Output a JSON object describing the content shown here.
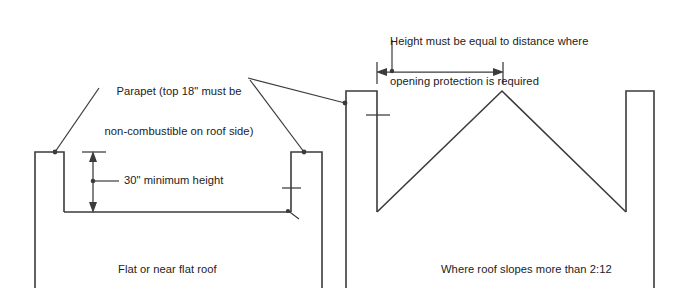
{
  "diagram": {
    "ink_color": "#3b3b3b",
    "background_color": "#ffffff",
    "labels": {
      "parapet_note": {
        "line1": "Parapet (top 18\" must be",
        "line2": "non-combustible on roof side)"
      },
      "height_rule_note": {
        "line1": "Height must be equal to distance where",
        "line2": "opening protection is required"
      },
      "minimum_height": "30\" minimum height",
      "flat_roof_caption": "Flat or near flat roof",
      "sloped_roof_caption": "Where roof slopes more than 2:12"
    },
    "dimensions": {
      "vertical_min_height_value": "30\"",
      "vertical_min_height_unit_note": "minimum height",
      "roof_slope_threshold": "2:12",
      "noncombustible_top_depth": "18\""
    }
  }
}
